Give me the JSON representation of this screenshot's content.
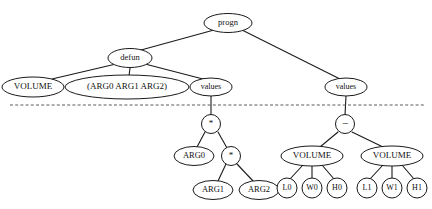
{
  "figure": {
    "kind": "expression-tree-diagram",
    "background_color": "#ffffff",
    "node_fill_color": "#ffffff",
    "node_stroke_color": "#1a1a1a",
    "edge_color": "#1a1a1a",
    "cut_line_color": "#5a5a5a",
    "cut_line_style": "dashed",
    "cut_line": {
      "x1": 10,
      "y1": 105,
      "x2": 426,
      "y2": 105
    }
  },
  "nodes": [
    {
      "id": "progn",
      "label": "progn",
      "cx": 228,
      "cy": 23,
      "rx": 24,
      "ry": 9.5,
      "font_size": 8.5,
      "shape": "ellipse"
    },
    {
      "id": "defun",
      "label": "defun",
      "cx": 130,
      "cy": 58,
      "rx": 22,
      "ry": 9.5,
      "font_size": 8.5,
      "shape": "ellipse"
    },
    {
      "id": "volume0",
      "label": "VOLUME",
      "cx": 33,
      "cy": 87,
      "rx": 31,
      "ry": 10,
      "font_size": 9,
      "shape": "ellipse"
    },
    {
      "id": "arglist",
      "label": "(ARG0 ARG1 ARG2)",
      "cx": 127,
      "cy": 87,
      "rx": 62,
      "ry": 12,
      "font_size": 9,
      "shape": "ellipse"
    },
    {
      "id": "values0",
      "label": "values",
      "cx": 211,
      "cy": 87,
      "rx": 21,
      "ry": 9,
      "font_size": 8,
      "shape": "ellipse"
    },
    {
      "id": "values1",
      "label": "values",
      "cx": 346,
      "cy": 87,
      "rx": 21,
      "ry": 9,
      "font_size": 8,
      "shape": "ellipse"
    },
    {
      "id": "mul0",
      "label": "*",
      "cx": 211,
      "cy": 124,
      "rx": 9.5,
      "ry": 9.5,
      "font_size": 9,
      "shape": "circle"
    },
    {
      "id": "arg0",
      "label": "ARG0",
      "cx": 194,
      "cy": 156,
      "rx": 20,
      "ry": 9.5,
      "font_size": 8.5,
      "shape": "ellipse"
    },
    {
      "id": "mul1",
      "label": "*",
      "cx": 231,
      "cy": 156,
      "rx": 9.5,
      "ry": 9.5,
      "font_size": 9,
      "shape": "circle"
    },
    {
      "id": "arg1",
      "label": "ARG1",
      "cx": 213,
      "cy": 190,
      "rx": 20,
      "ry": 9.5,
      "font_size": 8.5,
      "shape": "ellipse"
    },
    {
      "id": "arg2",
      "label": "ARG2",
      "cx": 259,
      "cy": 190,
      "rx": 20,
      "ry": 9.5,
      "font_size": 8.5,
      "shape": "ellipse"
    },
    {
      "id": "minus",
      "label": "−",
      "cx": 345,
      "cy": 124,
      "rx": 9.5,
      "ry": 9.5,
      "font_size": 11,
      "shape": "circle"
    },
    {
      "id": "volume1",
      "label": "VOLUME",
      "cx": 312,
      "cy": 156,
      "rx": 31,
      "ry": 10,
      "font_size": 9,
      "shape": "ellipse"
    },
    {
      "id": "volume2",
      "label": "VOLUME",
      "cx": 392,
      "cy": 156,
      "rx": 31,
      "ry": 10,
      "font_size": 9,
      "shape": "ellipse"
    },
    {
      "id": "l0",
      "label": "L0",
      "cx": 287,
      "cy": 188,
      "rx": 10,
      "ry": 10,
      "font_size": 8,
      "shape": "circle"
    },
    {
      "id": "w0",
      "label": "W0",
      "cx": 312,
      "cy": 188,
      "rx": 10,
      "ry": 10,
      "font_size": 8,
      "shape": "circle"
    },
    {
      "id": "h0",
      "label": "H0",
      "cx": 337,
      "cy": 188,
      "rx": 10,
      "ry": 10,
      "font_size": 8,
      "shape": "circle"
    },
    {
      "id": "l1",
      "label": "L1",
      "cx": 367,
      "cy": 188,
      "rx": 10,
      "ry": 10,
      "font_size": 8,
      "shape": "circle"
    },
    {
      "id": "w1",
      "label": "W1",
      "cx": 392,
      "cy": 188,
      "rx": 10,
      "ry": 10,
      "font_size": 8,
      "shape": "circle"
    },
    {
      "id": "h1",
      "label": "H1",
      "cx": 417,
      "cy": 188,
      "rx": 10,
      "ry": 10,
      "font_size": 8,
      "shape": "circle"
    }
  ],
  "edges": [
    {
      "from": "progn",
      "to": "defun",
      "x1": 214,
      "y1": 30,
      "x2": 141,
      "y2": 50
    },
    {
      "from": "progn",
      "to": "values1",
      "x1": 242,
      "y1": 30,
      "x2": 340,
      "y2": 79
    },
    {
      "from": "defun",
      "to": "volume0",
      "x1": 116,
      "y1": 64,
      "x2": 52,
      "y2": 79
    },
    {
      "from": "defun",
      "to": "arglist",
      "x1": 130,
      "y1": 68,
      "x2": 129,
      "y2": 76
    },
    {
      "from": "defun",
      "to": "values0",
      "x1": 145,
      "y1": 64,
      "x2": 203,
      "y2": 79
    },
    {
      "from": "values0",
      "to": "mul0",
      "x1": 211,
      "y1": 96,
      "x2": 211,
      "y2": 115
    },
    {
      "from": "mul0",
      "to": "arg0",
      "x1": 205,
      "y1": 132,
      "x2": 197,
      "y2": 147
    },
    {
      "from": "mul0",
      "to": "mul1",
      "x1": 218,
      "y1": 132,
      "x2": 227,
      "y2": 148
    },
    {
      "from": "mul1",
      "to": "arg1",
      "x1": 226,
      "y1": 164,
      "x2": 218,
      "y2": 181
    },
    {
      "from": "mul1",
      "to": "arg2",
      "x1": 237,
      "y1": 164,
      "x2": 253,
      "y2": 181
    },
    {
      "from": "values1",
      "to": "minus",
      "x1": 346,
      "y1": 96,
      "x2": 345,
      "y2": 115
    },
    {
      "from": "minus",
      "to": "volume1",
      "x1": 338,
      "y1": 132,
      "x2": 320,
      "y2": 147
    },
    {
      "from": "minus",
      "to": "volume2",
      "x1": 352,
      "y1": 132,
      "x2": 383,
      "y2": 147
    },
    {
      "from": "volume1",
      "to": "l0",
      "x1": 303,
      "y1": 165,
      "x2": 290,
      "y2": 179
    },
    {
      "from": "volume1",
      "to": "w0",
      "x1": 312,
      "y1": 166,
      "x2": 312,
      "y2": 178
    },
    {
      "from": "volume1",
      "to": "h0",
      "x1": 322,
      "y1": 165,
      "x2": 334,
      "y2": 179
    },
    {
      "from": "volume2",
      "to": "l1",
      "x1": 383,
      "y1": 165,
      "x2": 370,
      "y2": 179
    },
    {
      "from": "volume2",
      "to": "w1",
      "x1": 392,
      "y1": 166,
      "x2": 392,
      "y2": 178
    },
    {
      "from": "volume2",
      "to": "h1",
      "x1": 402,
      "y1": 165,
      "x2": 414,
      "y2": 179
    }
  ]
}
